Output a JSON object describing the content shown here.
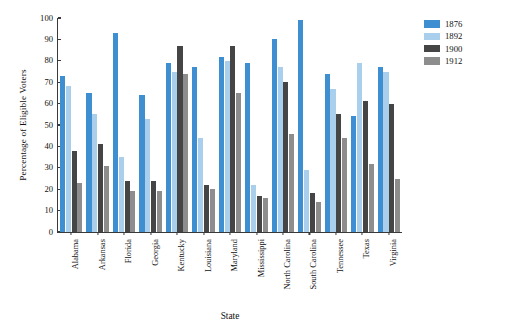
{
  "chart_data": {
    "type": "bar",
    "title": "",
    "xlabel": "State",
    "ylabel": "Percentage of Eligible Voters",
    "ylim": [
      0,
      100
    ],
    "yticks": [
      0,
      10,
      20,
      30,
      40,
      50,
      60,
      70,
      80,
      90,
      100
    ],
    "grid": false,
    "legend_position": "top-right",
    "categories": [
      "Alabama",
      "Arkansas",
      "Florida",
      "Georgia",
      "Kentucky",
      "Louisiana",
      "Maryland",
      "Mississippi",
      "North Carolina",
      "South Carolina",
      "Tennessee",
      "Texas",
      "Virginia"
    ],
    "series": [
      {
        "name": "1876",
        "color": "#3d8fd1",
        "values": [
          73,
          65,
          93,
          64,
          79,
          77,
          82,
          79,
          90,
          99,
          74,
          54,
          77
        ]
      },
      {
        "name": "1892",
        "color": "#a9cfec",
        "values": [
          68,
          55,
          35,
          53,
          75,
          44,
          80,
          22,
          77,
          29,
          67,
          79,
          75
        ]
      },
      {
        "name": "1900",
        "color": "#454545",
        "values": [
          38,
          41,
          24,
          24,
          87,
          22,
          87,
          17,
          70,
          18,
          55,
          61,
          60
        ]
      },
      {
        "name": "1912",
        "color": "#8d8d8d",
        "values": [
          23,
          31,
          19,
          19,
          74,
          20,
          65,
          16,
          46,
          14,
          44,
          32,
          25
        ]
      }
    ]
  }
}
